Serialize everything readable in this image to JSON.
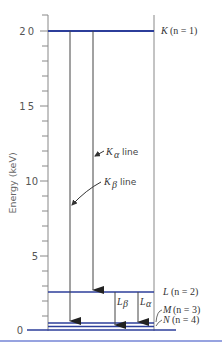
{
  "diagram": {
    "y_axis": {
      "label": "Energy (keV)",
      "ticks": [
        "0",
        "5",
        "10",
        "15",
        "20"
      ],
      "range": [
        0,
        21
      ]
    },
    "levels": [
      {
        "id": "K",
        "label_letter": "K",
        "label_n": "(n = 1)",
        "energy_kev": 20
      },
      {
        "id": "L",
        "label_letter": "L",
        "label_n": "(n = 2)",
        "energy_kev": 2.5
      },
      {
        "id": "M",
        "label_letter": "M",
        "label_n": "(n = 3)",
        "energy_kev": 0.5
      },
      {
        "id": "N",
        "label_letter": "N",
        "label_n": "(n = 4)",
        "energy_kev": 0.2
      }
    ],
    "transitions": [
      {
        "id": "K-alpha",
        "symbol": "K",
        "subscript": "α",
        "suffix": "line",
        "from": "L",
        "to": "K"
      },
      {
        "id": "K-beta",
        "symbol": "K",
        "subscript": "β",
        "suffix": "line",
        "from": "M",
        "to": "K"
      },
      {
        "id": "L-beta",
        "symbol": "L",
        "subscript": "β",
        "from": "N",
        "to": "L"
      },
      {
        "id": "L-alpha",
        "symbol": "L",
        "subscript": "α",
        "from": "M",
        "to": "L"
      }
    ],
    "colors": {
      "level_line": "#2c3e9a",
      "arrow": "#333333",
      "axis": "#777777",
      "footer_rule": "#5a6cc8"
    }
  }
}
